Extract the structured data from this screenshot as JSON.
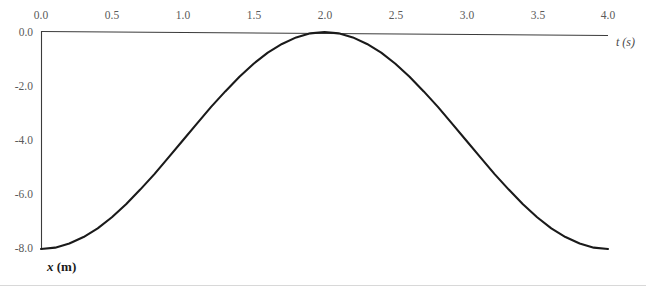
{
  "figure": {
    "background_color": "#ffffff",
    "curve_color": "#1a1a1a",
    "axis_color": "#3b3b3b",
    "tick_label_color": "#5a5a5a"
  },
  "axes": {
    "x_axis_title": "t (s)",
    "y_axis_title_italic": "x",
    "y_axis_title_upright": " (m)",
    "x_tick_labels": [
      "0.0",
      "0.5",
      "1.0",
      "1.5",
      "2.0",
      "2.5",
      "3.0",
      "3.5",
      "4.0"
    ],
    "y_tick_labels": [
      "0.0",
      "-2.0",
      "-4.0",
      "-6.0",
      "-8.0"
    ]
  },
  "chart_data": {
    "type": "line",
    "title": "",
    "xlabel": "t (s)",
    "ylabel": "x (m)",
    "xlim": [
      0.0,
      4.0
    ],
    "ylim": [
      -8.0,
      0.0
    ],
    "xticks": [
      0.0,
      0.5,
      1.0,
      1.5,
      2.0,
      2.5,
      3.0,
      3.5,
      4.0
    ],
    "yticks": [
      0.0,
      -2.0,
      -4.0,
      -6.0,
      -8.0
    ],
    "grid": false,
    "legend": false,
    "series": [
      {
        "name": "x(t)",
        "equation": "x = -4 - 4*cos(pi*t/2)",
        "x": [
          0.0,
          0.1,
          0.2,
          0.3,
          0.4,
          0.5,
          0.6,
          0.7,
          0.8,
          0.9,
          1.0,
          1.1,
          1.2,
          1.3,
          1.4,
          1.5,
          1.6,
          1.7,
          1.8,
          1.9,
          2.0,
          2.1,
          2.2,
          2.3,
          2.4,
          2.5,
          2.6,
          2.7,
          2.8,
          2.9,
          3.0,
          3.1,
          3.2,
          3.3,
          3.4,
          3.5,
          3.6,
          3.7,
          3.8,
          3.9,
          4.0
        ],
        "values": [
          -8.0,
          -7.95,
          -7.8,
          -7.56,
          -7.24,
          -6.83,
          -6.35,
          -5.81,
          -5.24,
          -4.62,
          -4.0,
          -3.38,
          -2.76,
          -2.19,
          -1.65,
          -1.17,
          -0.76,
          -0.44,
          -0.2,
          -0.05,
          0.0,
          -0.05,
          -0.2,
          -0.44,
          -0.76,
          -1.17,
          -1.65,
          -2.19,
          -2.76,
          -3.38,
          -4.0,
          -4.62,
          -5.24,
          -5.81,
          -6.35,
          -6.83,
          -7.24,
          -7.56,
          -7.8,
          -7.95,
          -8.0
        ]
      }
    ]
  }
}
